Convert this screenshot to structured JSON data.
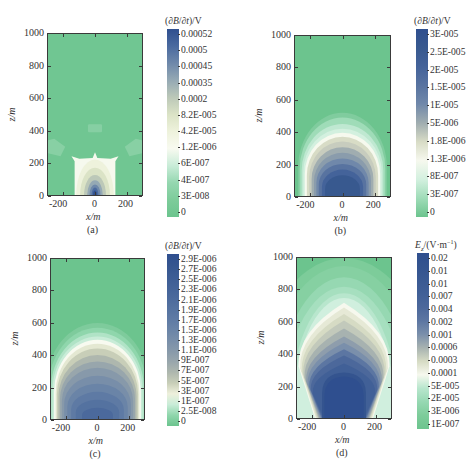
{
  "chart_data": [
    {
      "id": "a",
      "type": "heatmap",
      "panel_label": "(a)",
      "xlabel": "x/m",
      "ylabel": "z/m",
      "xlim": [
        -300,
        300
      ],
      "ylim": [
        0,
        1000
      ],
      "xticks": [
        -200,
        0,
        200
      ],
      "yticks": [
        0,
        200,
        400,
        600,
        800,
        1000
      ],
      "colorbar_title": "(∂B/∂t)/V",
      "colorbar_labels": [
        "0.00052",
        "0.0005",
        "0.00045",
        "0.00035",
        "0.0002",
        "8.2E-005",
        "4.2E-005",
        "1.2E-006",
        "6E-007",
        "4E-007",
        "3E-008",
        "0"
      ],
      "colorbar_colors": [
        "#2f4f8f",
        "#4a6a9f",
        "#6e88aa",
        "#95a9b4",
        "#bcc8b8",
        "#dbe3c6",
        "#eef2dc",
        "#f8faf0",
        "#c9ecd8",
        "#95d7b0",
        "#7dcc9a",
        "#6cc48e"
      ],
      "description": "Low-value green field with a white rectangular zone |x|<130 m, z<210 m, a dark blue spot near origin and pale patches near z=250-340 m at x=±250 m and z=390-440 m at x≈0"
    },
    {
      "id": "b",
      "type": "heatmap",
      "panel_label": "(b)",
      "xlabel": "x/m",
      "ylabel": "z/m",
      "xlim": [
        -300,
        300
      ],
      "ylim": [
        0,
        1000
      ],
      "xticks": [
        -200,
        0,
        200
      ],
      "yticks": [
        0,
        200,
        400,
        600,
        800,
        1000
      ],
      "colorbar_title": "(∂B/∂t)/V",
      "colorbar_labels": [
        "3E-005",
        "2.5E-005",
        "2E-005",
        "1.5E-005",
        "1E-005",
        "5E-006",
        "1.8E-006",
        "1.3E-006",
        "8E-007",
        "3E-007",
        "0"
      ],
      "colorbar_colors": [
        "#2f4f8f",
        "#38598f",
        "#44639a",
        "#5873a0",
        "#7088aa",
        "#a0adb0",
        "#d8dcc6",
        "#f6f8ee",
        "#d3f0df",
        "#9fdcb8",
        "#6cc48e"
      ],
      "description": "Dome-shaped anomaly centered at x=0 reaching ~470 m height, bright white ring near z≈380 m, dark blue core near bottom"
    },
    {
      "id": "c",
      "type": "heatmap",
      "panel_label": "(c)",
      "xlabel": "x/m",
      "ylabel": "z/m",
      "xlim": [
        -300,
        300
      ],
      "ylim": [
        0,
        1000
      ],
      "xticks": [
        -200,
        0,
        200
      ],
      "yticks": [
        0,
        200,
        400,
        600,
        800,
        1000
      ],
      "colorbar_title": "(∂B/∂t)/V",
      "colorbar_labels": [
        "2.9E-006",
        "2.7E-006",
        "2.5E-006",
        "2.3E-006",
        "2.1E-006",
        "1.9E-006",
        "1.7E-006",
        "1.5E-006",
        "1.3E-006",
        "1.1E-006",
        "9E-007",
        "7E-007",
        "5E-007",
        "3E-007",
        "1E-007",
        "2.5E-008",
        "0"
      ],
      "colorbar_colors": [
        "#2f4f8f",
        "#35558f",
        "#3c5c94",
        "#436298",
        "#4b699c",
        "#5472a0",
        "#5e7aa4",
        "#6a84a7",
        "#788ea9",
        "#8799aa",
        "#98a6ac",
        "#aeb7ae",
        "#c8ceb8",
        "#eef0dc",
        "#c9ecd8",
        "#8fd6ac",
        "#6cc48e"
      ],
      "description": "Larger dome reaching ~560 m, white ring at ~490 m, gray-blue interior, darkest near bottom center"
    },
    {
      "id": "d",
      "type": "heatmap",
      "panel_label": "(d)",
      "xlabel": "x/m",
      "ylabel": "z/m",
      "xlim": [
        -300,
        300
      ],
      "ylim": [
        0,
        1000
      ],
      "xticks": [
        -200,
        0,
        200
      ],
      "yticks": [
        0,
        200,
        400,
        600,
        800,
        1000
      ],
      "colorbar_title": "Ez/(V·m⁻¹)",
      "colorbar_labels": [
        "0.02",
        "0.01",
        "0.01",
        "0.007",
        "0.004",
        "0.002",
        "0.001",
        "0.0006",
        "0.0003",
        "0.0001",
        "5E-005",
        "2E-005",
        "3E-006",
        "1E-007"
      ],
      "colorbar_colors": [
        "#2f4f8f",
        "#34548f",
        "#3a5a93",
        "#416097",
        "#4c689b",
        "#5c76a2",
        "#7a8fab",
        "#a7b2b0",
        "#d6dbc4",
        "#f6f8ee",
        "#b8e6cd",
        "#96d8b2",
        "#7dcc9a",
        "#6cc48e"
      ],
      "description": "Broad mushroom-shaped field: dark blue column |x|<150 m below ~280 m, broad blue region to ~450 m, white band near ~680-740 m, light green layers above"
    }
  ],
  "panels": {
    "a": {
      "label": "(a)",
      "xlabel": "x/m",
      "ylabel": "z/m",
      "cbar_title_pre": "(∂",
      "cbar_title_mid": "B",
      "cbar_title_post": "/∂",
      "cbar_title_t": "t",
      "cbar_title_end": ")/V"
    },
    "b": {
      "label": "(b)",
      "xlabel": "x/m",
      "ylabel": "z/m",
      "cbar_title_pre": "(∂",
      "cbar_title_mid": "B",
      "cbar_title_post": "/∂",
      "cbar_title_t": "t",
      "cbar_title_end": ")/V"
    },
    "c": {
      "label": "(c)",
      "xlabel": "x/m",
      "ylabel": "z/m",
      "cbar_title_pre": "(∂",
      "cbar_title_mid": "B",
      "cbar_title_post": "/∂",
      "cbar_title_t": "t",
      "cbar_title_end": ")/V"
    },
    "d": {
      "label": "(d)",
      "xlabel": "x/m",
      "ylabel": "z/m",
      "cbar_title_e": "E",
      "cbar_title_sub": "z",
      "cbar_title_rest": "/(V·m",
      "cbar_title_sup": "−1",
      "cbar_title_end": ")"
    }
  }
}
